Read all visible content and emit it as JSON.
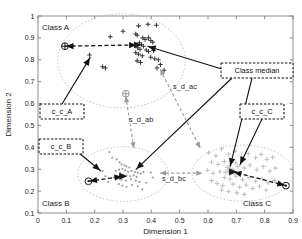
{
  "figure": {
    "background": "#ffffff",
    "axis_color": "#808080",
    "plot_area": {
      "left": 0.0,
      "right": 0.9,
      "bottom": 0.1,
      "top": 1.0
    }
  },
  "axes": {
    "xlabel": "Dimension 1",
    "ylabel": "Dimension 2",
    "xticks": [
      "0",
      "0.1",
      "0.2",
      "0.3",
      "0.4",
      "0.5",
      "0.6",
      "0.7",
      "0.8",
      "0.9"
    ],
    "yticks": [
      "0.1",
      "0.2",
      "0.3",
      "0.4",
      "0.5",
      "0.6",
      "0.7",
      "0.8",
      "0.9",
      "1"
    ]
  },
  "cluster_labels": {
    "class_a": "Class A",
    "class_b": "Class B",
    "class_c": "Class C"
  },
  "callouts": [
    {
      "id": "c_c_A",
      "label": "c_c_A",
      "x": 40,
      "y": 104,
      "w": 44,
      "h": 15
    },
    {
      "id": "c_c_B",
      "label": "c_c_B",
      "x": 39,
      "y": 139,
      "w": 44,
      "h": 15
    },
    {
      "id": "c_c_C",
      "label": "c_c_C",
      "x": 240,
      "y": 104,
      "w": 44,
      "h": 15
    },
    {
      "id": "class_median",
      "label": "Class median",
      "x": 221,
      "y": 63,
      "w": 72,
      "h": 15
    }
  ],
  "distance_labels": [
    {
      "id": "s_d_ab",
      "label": "s_d_ab",
      "x": 129,
      "y": 122
    },
    {
      "id": "s_d_ac",
      "label": "s_d_ac",
      "x": 173,
      "y": 89
    },
    {
      "id": "s_d_bc",
      "label": "s_d_bc",
      "x": 162,
      "y": 181
    }
  ],
  "chart_data": {
    "type": "scatter",
    "title": "",
    "xlabel": "Dimension 1",
    "ylabel": "Dimension 2",
    "xlim": [
      0.0,
      0.9
    ],
    "ylim": [
      0.1,
      1.0
    ],
    "grid": false,
    "legend": "none",
    "series": [
      {
        "name": "Class A",
        "marker": "plus",
        "color": "#3a3a3a",
        "points": [
          [
            0.255,
            0.905
          ],
          [
            0.3,
            0.93
          ],
          [
            0.355,
            0.955
          ],
          [
            0.388,
            0.962
          ],
          [
            0.418,
            0.958
          ],
          [
            0.345,
            0.918
          ],
          [
            0.35,
            0.912
          ],
          [
            0.37,
            0.9
          ],
          [
            0.378,
            0.893
          ],
          [
            0.39,
            0.9
          ],
          [
            0.398,
            0.888
          ],
          [
            0.405,
            0.88
          ],
          [
            0.358,
            0.878
          ],
          [
            0.365,
            0.87
          ],
          [
            0.372,
            0.862
          ],
          [
            0.352,
            0.855
          ],
          [
            0.36,
            0.848
          ],
          [
            0.382,
            0.845
          ],
          [
            0.39,
            0.838
          ],
          [
            0.408,
            0.842
          ],
          [
            0.345,
            0.832
          ],
          [
            0.355,
            0.825
          ],
          [
            0.368,
            0.818
          ],
          [
            0.398,
            0.812
          ],
          [
            0.412,
            0.805
          ],
          [
            0.425,
            0.8
          ],
          [
            0.182,
            0.822
          ],
          [
            0.228,
            0.768
          ],
          [
            0.238,
            0.762
          ],
          [
            0.35,
            0.795
          ],
          [
            0.362,
            0.788
          ],
          [
            0.432,
            0.778
          ],
          [
            0.42,
            0.762
          ],
          [
            0.445,
            0.752
          ]
        ]
      },
      {
        "name": "Class B",
        "marker": "dot",
        "color": "#9a9a9a",
        "points": [
          [
            0.252,
            0.378
          ],
          [
            0.262,
            0.352
          ],
          [
            0.278,
            0.345
          ],
          [
            0.288,
            0.332
          ],
          [
            0.295,
            0.322
          ],
          [
            0.305,
            0.318
          ],
          [
            0.312,
            0.312
          ],
          [
            0.322,
            0.308
          ],
          [
            0.298,
            0.302
          ],
          [
            0.286,
            0.298
          ],
          [
            0.275,
            0.292
          ],
          [
            0.308,
            0.295
          ],
          [
            0.318,
            0.288
          ],
          [
            0.33,
            0.292
          ],
          [
            0.342,
            0.288
          ],
          [
            0.352,
            0.284
          ],
          [
            0.362,
            0.28
          ],
          [
            0.372,
            0.288
          ],
          [
            0.29,
            0.282
          ],
          [
            0.3,
            0.275
          ],
          [
            0.312,
            0.272
          ],
          [
            0.325,
            0.268
          ],
          [
            0.338,
            0.272
          ],
          [
            0.348,
            0.265
          ],
          [
            0.268,
            0.262
          ],
          [
            0.282,
            0.258
          ],
          [
            0.295,
            0.252
          ],
          [
            0.31,
            0.248
          ],
          [
            0.328,
            0.255
          ],
          [
            0.345,
            0.248
          ],
          [
            0.358,
            0.242
          ],
          [
            0.285,
            0.232
          ],
          [
            0.298,
            0.225
          ],
          [
            0.312,
            0.22
          ],
          [
            0.332,
            0.228
          ],
          [
            0.352,
            0.222
          ],
          [
            0.398,
            0.285
          ],
          [
            0.405,
            0.262
          ],
          [
            0.382,
            0.238
          ],
          [
            0.368,
            0.208
          ],
          [
            0.228,
            0.292
          ],
          [
            0.238,
            0.268
          ],
          [
            0.248,
            0.242
          ]
        ]
      },
      {
        "name": "Class C",
        "marker": "plus",
        "color": "#c2c2c2",
        "points": [
          [
            0.602,
            0.375
          ],
          [
            0.628,
            0.362
          ],
          [
            0.648,
            0.392
          ],
          [
            0.672,
            0.368
          ],
          [
            0.695,
            0.382
          ],
          [
            0.718,
            0.358
          ],
          [
            0.742,
            0.372
          ],
          [
            0.768,
            0.352
          ],
          [
            0.788,
            0.368
          ],
          [
            0.808,
            0.345
          ],
          [
            0.828,
            0.355
          ],
          [
            0.612,
            0.332
          ],
          [
            0.635,
            0.322
          ],
          [
            0.658,
            0.335
          ],
          [
            0.678,
            0.318
          ],
          [
            0.698,
            0.328
          ],
          [
            0.668,
            0.308
          ],
          [
            0.678,
            0.302
          ],
          [
            0.688,
            0.298
          ],
          [
            0.672,
            0.292
          ],
          [
            0.682,
            0.288
          ],
          [
            0.692,
            0.282
          ],
          [
            0.662,
            0.285
          ],
          [
            0.676,
            0.278
          ],
          [
            0.705,
            0.312
          ],
          [
            0.728,
            0.305
          ],
          [
            0.748,
            0.318
          ],
          [
            0.772,
            0.298
          ],
          [
            0.795,
            0.312
          ],
          [
            0.818,
            0.292
          ],
          [
            0.838,
            0.305
          ],
          [
            0.598,
            0.295
          ],
          [
            0.618,
            0.282
          ],
          [
            0.642,
            0.288
          ],
          [
            0.658,
            0.262
          ],
          [
            0.678,
            0.255
          ],
          [
            0.698,
            0.268
          ],
          [
            0.722,
            0.252
          ],
          [
            0.745,
            0.262
          ],
          [
            0.768,
            0.245
          ],
          [
            0.792,
            0.255
          ],
          [
            0.812,
            0.238
          ],
          [
            0.835,
            0.248
          ],
          [
            0.612,
            0.248
          ],
          [
            0.632,
            0.235
          ],
          [
            0.652,
            0.225
          ],
          [
            0.688,
            0.232
          ],
          [
            0.712,
            0.218
          ],
          [
            0.735,
            0.228
          ],
          [
            0.758,
            0.212
          ],
          [
            0.782,
            0.222
          ],
          [
            0.805,
            0.205
          ],
          [
            0.648,
            0.205
          ],
          [
            0.672,
            0.198
          ],
          [
            0.702,
            0.192
          ],
          [
            0.728,
            0.185
          ]
        ]
      }
    ],
    "ellipses": [
      {
        "name": "Class A",
        "cx": 0.295,
        "cy": 0.795,
        "rx": 0.225,
        "ry": 0.215
      },
      {
        "name": "Class B",
        "cx": 0.3,
        "cy": 0.278,
        "rx": 0.16,
        "ry": 0.125
      },
      {
        "name": "Class C",
        "cx": 0.722,
        "cy": 0.282,
        "rx": 0.178,
        "ry": 0.128
      }
    ],
    "centroids": [
      {
        "name": "c_c_A",
        "symbol": "circle-plus",
        "x": 0.095,
        "y": 0.862,
        "color": "#1a1a1a"
      },
      {
        "name": "c_c_B",
        "symbol": "circle-dot",
        "x": 0.178,
        "y": 0.245,
        "color": "#1a1a1a"
      },
      {
        "name": "c_c_C",
        "symbol": "circle-dot",
        "x": 0.875,
        "y": 0.225,
        "color": "#1a1a1a"
      }
    ],
    "medians": [
      {
        "name": "Class A median",
        "symbol": "triangle",
        "x": 0.352,
        "y": 0.868,
        "color": "#1a1a1a"
      },
      {
        "name": "Class A sub-median",
        "symbol": "circle-plus",
        "x": 0.31,
        "y": 0.645,
        "color": "#9a9a9a"
      },
      {
        "name": "Class B median",
        "symbol": "triangle",
        "x": 0.3,
        "y": 0.268,
        "color": "#1a1a1a"
      },
      {
        "name": "Class C median",
        "symbol": "triangle",
        "x": 0.688,
        "y": 0.288,
        "color": "#1a1a1a"
      }
    ],
    "distance_arrows": [
      {
        "name": "s_d_ab",
        "from": [
          0.31,
          0.632
        ],
        "to": [
          0.338,
          0.398
        ],
        "color": "#9a9a9a"
      },
      {
        "name": "s_d_ac",
        "from": [
          0.432,
          0.755
        ],
        "to": [
          0.572,
          0.398
        ],
        "color": "#9a9a9a"
      },
      {
        "name": "s_d_bc",
        "from": [
          0.432,
          0.282
        ],
        "to": [
          0.578,
          0.282
        ],
        "color": "#9a9a9a"
      }
    ]
  }
}
